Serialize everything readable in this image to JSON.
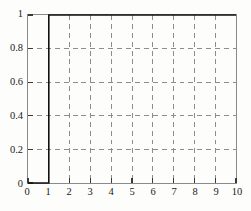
{
  "chart_data": {
    "type": "line",
    "title": "",
    "subtitle": "",
    "xlabel": "",
    "ylabel": "",
    "xlim": [
      0,
      10
    ],
    "ylim": [
      0,
      1
    ],
    "grid": true,
    "grid_style": "dashed",
    "legend": null,
    "legend_position": "none",
    "x_ticks": [
      0,
      1,
      2,
      3,
      4,
      5,
      6,
      7,
      8,
      9,
      10
    ],
    "x_tick_labels": [
      "0",
      "1",
      "2",
      "3",
      "4",
      "5",
      "6",
      "7",
      "8",
      "9",
      "10"
    ],
    "y_ticks": [
      0,
      0.2,
      0.4,
      0.6,
      0.8,
      1
    ],
    "y_tick_labels": [
      "0",
      "0.2",
      "0.4",
      "0.6",
      "0.8",
      "1"
    ],
    "series": [
      {
        "name": "step",
        "style": "step",
        "color": "#111111",
        "linewidth": 1.6,
        "points": [
          {
            "x": 0,
            "y": 0
          },
          {
            "x": 1,
            "y": 0
          },
          {
            "x": 1,
            "y": 1
          },
          {
            "x": 10,
            "y": 1
          }
        ]
      }
    ]
  },
  "colors": {
    "frame": "#8a8a8a",
    "grid": "#8c8c8c",
    "curve": "#111111",
    "label": "#1a1a1a",
    "background": "#fdfdfc"
  }
}
